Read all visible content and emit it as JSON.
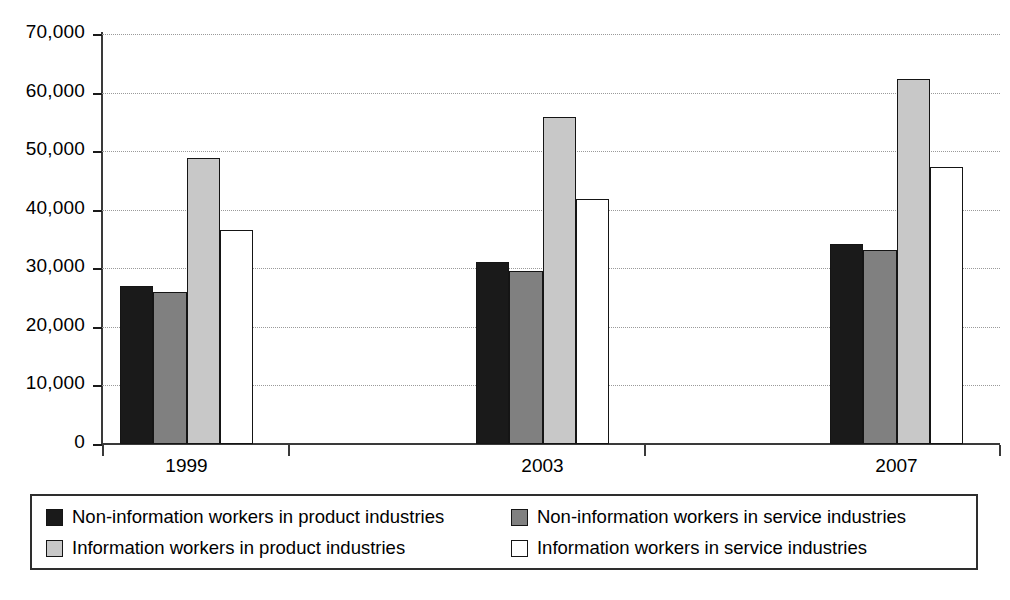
{
  "chart_data": {
    "type": "bar",
    "title": "",
    "subtitle": "",
    "xlabel": "",
    "ylabel": "",
    "categories": [
      "1999",
      "2003",
      "2007"
    ],
    "series": [
      {
        "name": "Non-information workers in product industries",
        "color": "#1a1a1a",
        "values": [
          27000,
          31100,
          34200
        ]
      },
      {
        "name": "Non-information workers in service industries",
        "color": "#808080",
        "values": [
          26000,
          29600,
          33200
        ]
      },
      {
        "name": "Information workers in product industries",
        "color": "#c8c8c8",
        "values": [
          48800,
          55900,
          62300
        ]
      },
      {
        "name": "Information workers in service industries",
        "color": "#ffffff",
        "values": [
          36500,
          41800,
          47300
        ]
      }
    ],
    "ylim": [
      0,
      70000
    ],
    "ytick_values": [
      0,
      10000,
      20000,
      30000,
      40000,
      50000,
      60000,
      70000
    ],
    "ytick_labels": [
      "0",
      "10,000",
      "20,000",
      "30,000",
      "40,000",
      "50,000",
      "60,000",
      "70,000"
    ],
    "grid": true,
    "grid_style": "dotted",
    "legend_position": "bottom",
    "legend_columns": 2,
    "bar_border_color": "#151515",
    "axis_color": "#3a3a3a"
  }
}
